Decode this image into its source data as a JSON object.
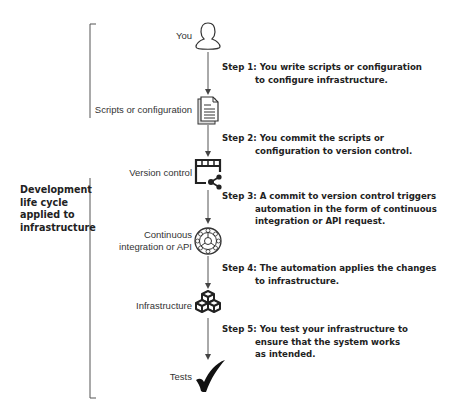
{
  "side_label": [
    "Development",
    "life cycle",
    "applied to",
    "infrastructure"
  ],
  "nodes": [
    {
      "label": "You",
      "icon": "person-icon"
    },
    {
      "label": "Scripts or configuration",
      "icon": "document-icon"
    },
    {
      "label": "Version control",
      "icon": "version-control-icon"
    },
    {
      "label_lines": [
        "Continuous",
        "integration or API"
      ],
      "icon": "ci-wheel-icon"
    },
    {
      "label": "Infrastructure",
      "icon": "cubes-icon"
    },
    {
      "label": "Tests",
      "icon": "checkmark-icon"
    }
  ],
  "steps": [
    {
      "head": "Step 1:",
      "lines": [
        "You write scripts or configuration",
        "to configure infrastructure."
      ]
    },
    {
      "head": "Step 2:",
      "lines": [
        "You commit the scripts or",
        "configuration to version control."
      ]
    },
    {
      "head": "Step 3:",
      "lines": [
        "A commit to version control triggers",
        "automation in the form of continuous",
        "integration or API request."
      ]
    },
    {
      "head": "Step 4:",
      "lines": [
        "The automation applies the changes",
        "to infrastructure."
      ]
    },
    {
      "head": "Step 5:",
      "lines": [
        "You test your infrastructure to",
        "ensure that the system works",
        "as intended."
      ]
    }
  ]
}
